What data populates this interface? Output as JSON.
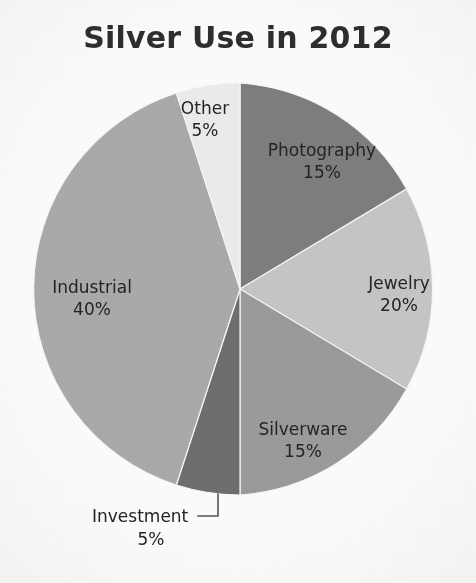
{
  "chart_data": {
    "type": "pie",
    "title": "Silver Use in 2012",
    "categories": [
      "Photography",
      "Jewelry",
      "Silverware",
      "Investment",
      "Industrial",
      "Other"
    ],
    "values": [
      15,
      20,
      15,
      5,
      40,
      5
    ],
    "value_unit": "%",
    "labels": [
      {
        "name": "Photography",
        "percent": "15%",
        "value": 15,
        "color": "#7e7e7e",
        "label_position": "inside"
      },
      {
        "name": "Jewelry",
        "percent": "20%",
        "value": 20,
        "color": "#c6c6c6",
        "label_position": "inside"
      },
      {
        "name": "Silverware",
        "percent": "15%",
        "value": 15,
        "color": "#9b9b9b",
        "label_position": "inside"
      },
      {
        "name": "Investment",
        "percent": "5%",
        "value": 5,
        "color": "#6e6e6e",
        "label_position": "outside-leader"
      },
      {
        "name": "Industrial",
        "percent": "40%",
        "value": 40,
        "color": "#aaaaaa",
        "label_position": "inside"
      },
      {
        "name": "Other",
        "percent": "5%",
        "value": 5,
        "color": "#ececec",
        "label_position": "inside"
      }
    ],
    "start_angle_deg": 0,
    "direction": "clockwise",
    "total": 100,
    "legend": "none",
    "grid": false,
    "xlabel": "",
    "ylabel": ""
  },
  "chart": {
    "title": "Silver Use in 2012",
    "slices": {
      "photography": {
        "name": "Photography",
        "percent": "15%"
      },
      "jewelry": {
        "name": "Jewelry",
        "percent": "20%"
      },
      "silverware": {
        "name": "Silverware",
        "percent": "15%"
      },
      "investment": {
        "name": "Investment",
        "percent": "5%"
      },
      "industrial": {
        "name": "Industrial",
        "percent": "40%"
      },
      "other": {
        "name": "Other",
        "percent": "5%"
      }
    }
  },
  "colors": {
    "background": "#fcfcfb",
    "text": "#242424",
    "title": "#2e2e2e",
    "photography": "#7e7e7e",
    "jewelry": "#c6c6c6",
    "silverware": "#9b9b9b",
    "investment": "#6e6e6e",
    "industrial": "#aaaaaa",
    "other": "#ececec",
    "leader_line": "#555555"
  }
}
